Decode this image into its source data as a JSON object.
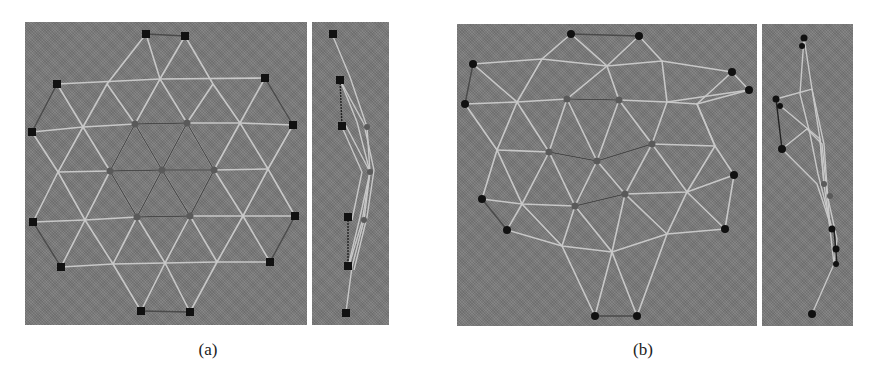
{
  "figure": {
    "subfigures": [
      {
        "label": "(a)",
        "description": "Planar triangular mesh (hexagonal patch) with front and side views",
        "views": [
          "front-view",
          "side-view"
        ]
      },
      {
        "label": "(b)",
        "description": "Deformed triangular mesh with front and side views",
        "views": [
          "front-view",
          "side-view"
        ]
      }
    ],
    "colors": {
      "background": "#7b7b7b",
      "edge_light": "#d6d6d6",
      "edge_dark": "#4a4a4a",
      "boundary_node": "#111111",
      "interior_node": "#5a5a5a"
    }
  }
}
